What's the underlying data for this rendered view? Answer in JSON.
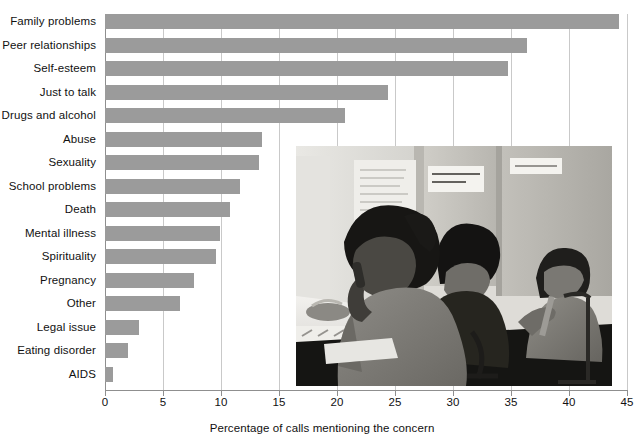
{
  "chart_data": {
    "type": "bar",
    "orientation": "horizontal",
    "title": "",
    "xlabel": "Percentage of calls mentioning the concern",
    "ylabel": "",
    "xlim": [
      0,
      45
    ],
    "xticks": [
      0,
      5,
      10,
      15,
      20,
      25,
      30,
      35,
      40,
      45
    ],
    "grid": "vertical",
    "legend": "none",
    "bar_color": "#9b9b9b",
    "categories": [
      "Family problems",
      "Peer relationships",
      "Self-esteem",
      "Just to talk",
      "Drugs and alcohol",
      "Abuse",
      "Sexuality",
      "School problems",
      "Death",
      "Mental illness",
      "Spirituality",
      "Pregnancy",
      "Other",
      "Legal issue",
      "Eating disorder",
      "AIDS"
    ],
    "values": [
      44.3,
      36.4,
      34.7,
      24.4,
      20.7,
      13.5,
      13.3,
      11.6,
      10.8,
      9.9,
      9.6,
      7.7,
      6.5,
      2.9,
      2.0,
      0.7
    ]
  },
  "inset_photo": {
    "description": "Black and white photograph of three young people seated at telephone helpline counselling booths",
    "wall_notes": [
      "Please ask you: how are they? Ask them yes, and they keep things here their...",
      "LISTEN WITH CARE\nSAVE A LIFE!",
      "SMILE AT YOU"
    ]
  },
  "axis": {
    "tick_labels": [
      "0",
      "5",
      "10",
      "15",
      "20",
      "25",
      "30",
      "35",
      "40",
      "45"
    ],
    "title": "Percentage of calls mentioning the concern"
  }
}
